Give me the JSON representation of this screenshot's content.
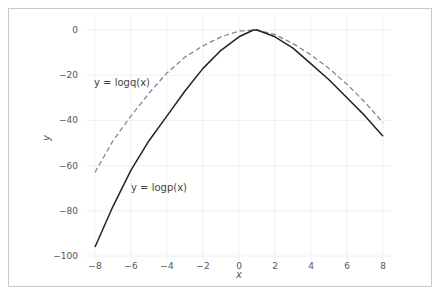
{
  "chart_data": {
    "type": "line",
    "title": "",
    "xlabel": "x",
    "ylabel": "y",
    "xlim": [
      -8.5,
      8.5
    ],
    "ylim": [
      -100,
      3
    ],
    "xticks": [
      -8,
      -6,
      -4,
      -2,
      0,
      2,
      4,
      6,
      8
    ],
    "yticks": [
      0,
      -20,
      -40,
      -60,
      -80,
      -100
    ],
    "xtick_labels": [
      "−8",
      "−6",
      "−4",
      "−2",
      "0",
      "2",
      "4",
      "6",
      "8"
    ],
    "ytick_labels": [
      "0",
      "−20",
      "−40",
      "−60",
      "−80",
      "−100"
    ],
    "grid": true,
    "legend": null,
    "annotations": [
      {
        "text": "y = logq(x)",
        "x": -8.1,
        "y": -25
      },
      {
        "text": "y = logp(x)",
        "x": -6.2,
        "y": -70
      }
    ],
    "x": [
      -8,
      -7,
      -6,
      -5,
      -4,
      -3,
      -2,
      -1,
      0,
      0.8,
      1,
      2,
      3,
      4,
      5,
      6,
      7,
      8
    ],
    "series": [
      {
        "name": "logp(x)",
        "style": "solid",
        "color": "#222222",
        "values": [
          -96,
          -78,
          -62,
          -49,
          -38,
          -27,
          -17,
          -9,
          -3,
          0,
          0,
          -3,
          -8,
          -15,
          -22,
          -30,
          -38,
          -47
        ]
      },
      {
        "name": "logq(x)",
        "style": "dashed",
        "color": "#888888",
        "values": [
          -63,
          -49,
          -38,
          -28,
          -19,
          -12,
          -7,
          -3,
          -0.5,
          0,
          0,
          -2,
          -6,
          -11,
          -17,
          -24,
          -32,
          -41
        ]
      }
    ]
  }
}
